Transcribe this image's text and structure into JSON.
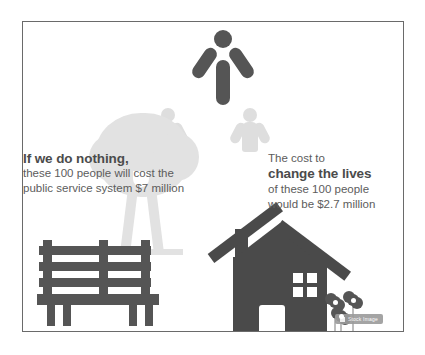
{
  "slide": {
    "background_color": "#ffffff",
    "border_color": "#6a6a6a"
  },
  "left_text": {
    "heading": "If we do nothing,",
    "line2": "these 100 people will cost the",
    "line3": "public service system $7 million"
  },
  "right_text": {
    "line1": "The cost to",
    "line2": "change the lives",
    "line3": "of these 100 people",
    "line4": "would be $2.7 million"
  },
  "illustrations": {
    "person_icon_label": "person-arms-raised",
    "ghost_left_label": "faded-person-left",
    "ghost_right_label": "faded-person-right",
    "tree_label": "tree",
    "bench_label": "park-bench",
    "house_label": "house",
    "flowers_label": "flowers"
  },
  "watermark": {
    "text": "Stock Image"
  },
  "colors": {
    "dark_figure": "#555555",
    "house_dark": "#4a4a4a",
    "light_gray": "#e2e2e2",
    "ghost_gray": "#dedede",
    "heading_text": "#4b4b4b",
    "body_text": "#5c5c5c",
    "watermark_bg": "#9b9b9b"
  }
}
